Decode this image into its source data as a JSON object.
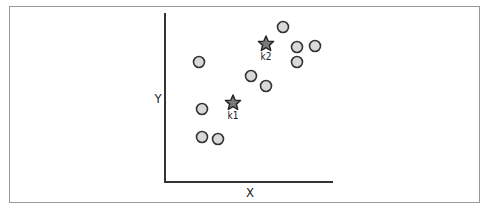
{
  "diagram": {
    "axis_labels": {
      "x": "X",
      "y": "Y"
    },
    "points": [
      {
        "x": 283,
        "y": 27
      },
      {
        "x": 297,
        "y": 47
      },
      {
        "x": 315,
        "y": 46
      },
      {
        "x": 297,
        "y": 62
      },
      {
        "x": 199,
        "y": 62
      },
      {
        "x": 251,
        "y": 76
      },
      {
        "x": 266,
        "y": 86
      },
      {
        "x": 202,
        "y": 109
      },
      {
        "x": 202,
        "y": 137
      },
      {
        "x": 218,
        "y": 139
      }
    ],
    "centroids": [
      {
        "label": "k1",
        "x": 233,
        "y": 103
      },
      {
        "label": "k2",
        "x": 266,
        "y": 44
      }
    ],
    "colors": {
      "point_fill": "#d9d9d9",
      "point_stroke": "#333333",
      "centroid_fill": "#7a7a7a",
      "centroid_stroke": "#222222",
      "axis": "#333333",
      "frame": "#9a9a9a"
    }
  }
}
